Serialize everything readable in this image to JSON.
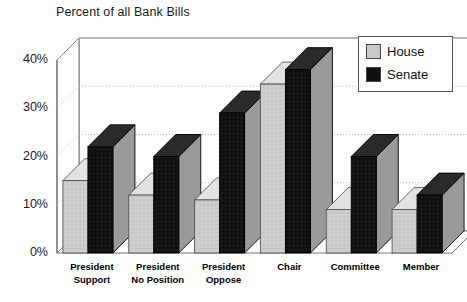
{
  "chart_data": {
    "type": "bar",
    "title": "Percent of all Bank Bills",
    "xlabel": "",
    "ylabel": "",
    "ylim": [
      0,
      40
    ],
    "ytick_labels": [
      "0%",
      "10%",
      "20%",
      "30%",
      "40%"
    ],
    "ytick_values": [
      0,
      10,
      20,
      30,
      40
    ],
    "grid": true,
    "legend_position": "top-right",
    "style": "3d-bar",
    "categories": [
      "President Support",
      "President No Position",
      "President Oppose",
      "Chair",
      "Committee",
      "Member"
    ],
    "category_lines": [
      [
        "President",
        "Support"
      ],
      [
        "President",
        "No Position"
      ],
      [
        "President",
        "Oppose"
      ],
      [
        "Chair",
        ""
      ],
      [
        "Committee",
        ""
      ],
      [
        "Member",
        ""
      ]
    ],
    "series": [
      {
        "name": "House",
        "color": "#c9c9c9",
        "values": [
          15,
          12,
          11,
          35,
          9,
          9
        ]
      },
      {
        "name": "Senate",
        "color": "#111111",
        "values": [
          22,
          20,
          29,
          38,
          20,
          12
        ]
      }
    ]
  },
  "legend": {
    "items": [
      {
        "label": "House",
        "color": "#c9c9c9"
      },
      {
        "label": "Senate",
        "color": "#111111"
      }
    ]
  },
  "axis": {
    "y_ticks": [
      "40%",
      "30%",
      "20%",
      "10%",
      "0%"
    ]
  },
  "colors": {
    "house": "#c9c9c9",
    "senate": "#111111",
    "frame": "#777777",
    "grid": "#bbbbbb",
    "text": "#1a1a1a",
    "background": "#ffffff"
  }
}
